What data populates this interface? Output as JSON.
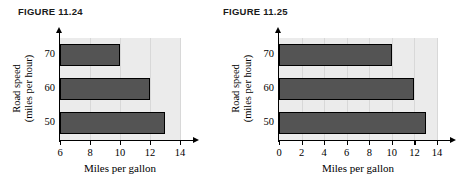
{
  "figures": [
    {
      "caption": "FIGURE 11.24",
      "chart_data": {
        "type": "bar",
        "orientation": "horizontal",
        "title": "",
        "xlabel": "Miles per gallon",
        "ylabel": "Road speed\n(miles per hour)",
        "ylabel_line1": "Road speed",
        "ylabel_line2": "(miles per hour)",
        "categories": [
          "50",
          "60",
          "70"
        ],
        "values": [
          13,
          12,
          10
        ],
        "xlim": [
          6,
          14
        ],
        "xticks": [
          6,
          8,
          10,
          12,
          14
        ],
        "xtick_labels": [
          "6",
          "8",
          "10",
          "12",
          "14"
        ],
        "ytick_labels": [
          "70",
          "60",
          "50"
        ],
        "grid": true,
        "legend": "none",
        "bar_color": "#545454",
        "plot_background": "#ebebeb"
      }
    },
    {
      "caption": "FIGURE 11.25",
      "chart_data": {
        "type": "bar",
        "orientation": "horizontal",
        "title": "",
        "xlabel": "Miles per gallon",
        "ylabel": "Road speed\n(miles per hour)",
        "ylabel_line1": "Road speed",
        "ylabel_line2": "(miles per hour)",
        "categories": [
          "50",
          "60",
          "70"
        ],
        "values": [
          13,
          12,
          10
        ],
        "xlim": [
          0,
          14
        ],
        "xticks": [
          0,
          2,
          4,
          6,
          8,
          10,
          12,
          14
        ],
        "xtick_labels": [
          "0",
          "2",
          "4",
          "6",
          "8",
          "10",
          "12",
          "14"
        ],
        "ytick_labels": [
          "70",
          "60",
          "50"
        ],
        "grid": true,
        "legend": "none",
        "bar_color": "#545454",
        "plot_background": "#ebebeb"
      }
    }
  ]
}
